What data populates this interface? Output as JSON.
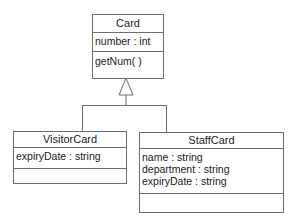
{
  "diagram": {
    "type": "uml-class-diagram",
    "classes": [
      {
        "name": "Card",
        "attributes": [
          "number : int"
        ],
        "operations": [
          "getNum( )"
        ]
      },
      {
        "name": "VisitorCard",
        "attributes": [
          "expiryDate : string"
        ],
        "operations": []
      },
      {
        "name": "StaffCard",
        "attributes": [
          "name : string",
          "department : string",
          "expiryDate : string"
        ],
        "operations": []
      }
    ],
    "relationships": [
      {
        "type": "generalization",
        "from": "VisitorCard",
        "to": "Card"
      },
      {
        "type": "generalization",
        "from": "StaffCard",
        "to": "Card"
      }
    ]
  }
}
